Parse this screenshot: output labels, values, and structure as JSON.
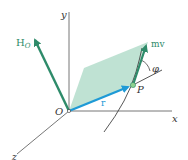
{
  "diagram": {
    "axes": {
      "x_label": "x",
      "y_label": "y",
      "z_label": "z",
      "origin_label": "O"
    },
    "vectors": {
      "angular_momentum": {
        "label_main": "H",
        "label_sub": "O",
        "color": "#2e8b6a"
      },
      "position": {
        "label": "r",
        "color": "#1e9ad6"
      },
      "linear_momentum": {
        "label": "mv",
        "color": "#2e8b6a"
      }
    },
    "point_label": "P",
    "angle_label": "φ",
    "plane_color": "#a9d8c4",
    "axis_color": "#777777"
  }
}
